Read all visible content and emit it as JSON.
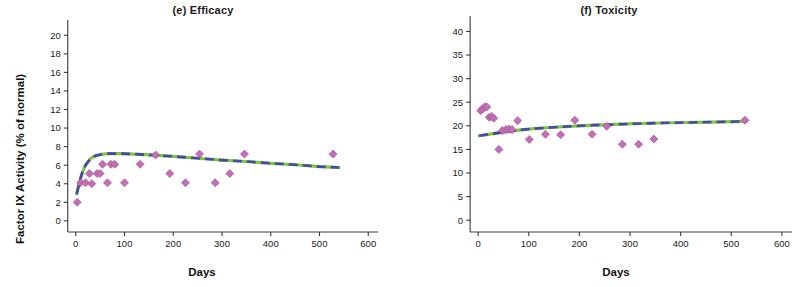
{
  "figure": {
    "panel_count": 2,
    "marker_color": "#c36fb4",
    "curve_green": "#7ac943",
    "curve_blue": "#4a46a8",
    "axis_color": "#3a3a3a",
    "text_color": "#1a1a1a"
  },
  "chart_data": [
    {
      "type": "scatter",
      "panel_label": "(e)",
      "title": "(e) Efficacy",
      "xlabel": "Days",
      "ylabel": "Factor IX Activity (% of normal)",
      "xlim": [
        -20,
        620
      ],
      "ylim": [
        -1.2,
        21
      ],
      "xticks": [
        0,
        100,
        200,
        300,
        400,
        500,
        600
      ],
      "xtick_labels": [
        "0",
        "100",
        "200",
        "300",
        "400",
        "500",
        "600"
      ],
      "yticks": [
        0,
        2,
        4,
        6,
        8,
        10,
        12,
        14,
        16,
        18,
        20
      ],
      "ytick_labels": [
        "0",
        "2",
        "4",
        "6",
        "8",
        "10",
        "12",
        "14",
        "16",
        "18",
        "20"
      ],
      "grid": false,
      "legend": "none",
      "points": [
        {
          "x": 3,
          "y": 2.0
        },
        {
          "x": 10,
          "y": 4.1
        },
        {
          "x": 20,
          "y": 4.1
        },
        {
          "x": 28,
          "y": 5.1
        },
        {
          "x": 33,
          "y": 4.0
        },
        {
          "x": 44,
          "y": 5.1
        },
        {
          "x": 50,
          "y": 5.1
        },
        {
          "x": 55,
          "y": 6.1
        },
        {
          "x": 65,
          "y": 4.1
        },
        {
          "x": 72,
          "y": 6.1
        },
        {
          "x": 80,
          "y": 6.1
        },
        {
          "x": 100,
          "y": 4.1
        },
        {
          "x": 132,
          "y": 6.1
        },
        {
          "x": 164,
          "y": 7.1
        },
        {
          "x": 193,
          "y": 5.1
        },
        {
          "x": 225,
          "y": 4.1
        },
        {
          "x": 254,
          "y": 7.2
        },
        {
          "x": 286,
          "y": 4.1
        },
        {
          "x": 316,
          "y": 5.1
        },
        {
          "x": 346,
          "y": 7.2
        },
        {
          "x": 528,
          "y": 7.2
        }
      ],
      "series": [
        {
          "name": "fit-green",
          "style": "solid-green",
          "x": [
            2,
            6,
            12,
            20,
            30,
            42,
            55,
            70,
            90,
            120,
            160,
            200,
            250,
            300,
            350,
            400,
            450,
            500,
            540
          ],
          "y": [
            2.9,
            3.8,
            5.0,
            6.0,
            6.7,
            7.05,
            7.2,
            7.25,
            7.25,
            7.2,
            7.08,
            6.95,
            6.75,
            6.55,
            6.4,
            6.2,
            6.05,
            5.85,
            5.75
          ]
        },
        {
          "name": "fit-blue",
          "style": "dashed-blue",
          "x": [
            2,
            6,
            12,
            20,
            30,
            42,
            55,
            70,
            90,
            120,
            160,
            200,
            250,
            300,
            350,
            400,
            450,
            500,
            540
          ],
          "y": [
            2.9,
            3.8,
            5.0,
            6.0,
            6.7,
            7.05,
            7.2,
            7.25,
            7.25,
            7.2,
            7.08,
            6.95,
            6.75,
            6.55,
            6.4,
            6.2,
            6.05,
            5.85,
            5.75
          ]
        }
      ]
    },
    {
      "type": "scatter",
      "panel_label": "(f)",
      "title": "(f) Toxicity",
      "xlabel": "Days",
      "ylabel": "ALT (IU/liter)",
      "xlim": [
        -20,
        620
      ],
      "ylim": [
        -2.5,
        42
      ],
      "xticks": [
        0,
        100,
        200,
        300,
        400,
        500,
        600
      ],
      "xtick_labels": [
        "0",
        "100",
        "200",
        "300",
        "400",
        "500",
        "600"
      ],
      "yticks": [
        0,
        5,
        10,
        15,
        20,
        25,
        30,
        35,
        40
      ],
      "ytick_labels": [
        "0",
        "5",
        "10",
        "15",
        "20",
        "25",
        "30",
        "35",
        "40"
      ],
      "grid": false,
      "legend": "none",
      "points": [
        {
          "x": 5,
          "y": 23.2
        },
        {
          "x": 9,
          "y": 23.6
        },
        {
          "x": 13,
          "y": 24.0
        },
        {
          "x": 17,
          "y": 24.0
        },
        {
          "x": 22,
          "y": 21.8
        },
        {
          "x": 27,
          "y": 22.0
        },
        {
          "x": 31,
          "y": 21.6
        },
        {
          "x": 41,
          "y": 15.0
        },
        {
          "x": 48,
          "y": 19.0
        },
        {
          "x": 55,
          "y": 19.2
        },
        {
          "x": 61,
          "y": 19.3
        },
        {
          "x": 67,
          "y": 19.2
        },
        {
          "x": 78,
          "y": 21.1
        },
        {
          "x": 101,
          "y": 17.1
        },
        {
          "x": 133,
          "y": 18.2
        },
        {
          "x": 163,
          "y": 18.1
        },
        {
          "x": 191,
          "y": 21.2
        },
        {
          "x": 225,
          "y": 18.2
        },
        {
          "x": 254,
          "y": 19.9
        },
        {
          "x": 285,
          "y": 16.1
        },
        {
          "x": 317,
          "y": 16.1
        },
        {
          "x": 347,
          "y": 17.2
        },
        {
          "x": 527,
          "y": 21.2
        }
      ],
      "series": [
        {
          "name": "fit-green",
          "style": "solid-green",
          "x": [
            2,
            20,
            40,
            60,
            80,
            110,
            150,
            190,
            230,
            270,
            310,
            360,
            410,
            460,
            510,
            530
          ],
          "y": [
            17.9,
            18.2,
            18.5,
            18.8,
            19.1,
            19.4,
            19.7,
            19.95,
            20.15,
            20.3,
            20.45,
            20.6,
            20.7,
            20.8,
            20.9,
            20.95
          ]
        },
        {
          "name": "fit-blue",
          "style": "dashed-blue",
          "x": [
            2,
            20,
            40,
            60,
            80,
            110,
            150,
            190,
            230,
            270,
            310,
            360,
            410,
            460,
            510,
            530
          ],
          "y": [
            17.9,
            18.2,
            18.5,
            18.8,
            19.1,
            19.4,
            19.7,
            19.95,
            20.15,
            20.3,
            20.45,
            20.6,
            20.7,
            20.8,
            20.9,
            20.95
          ]
        }
      ]
    }
  ]
}
